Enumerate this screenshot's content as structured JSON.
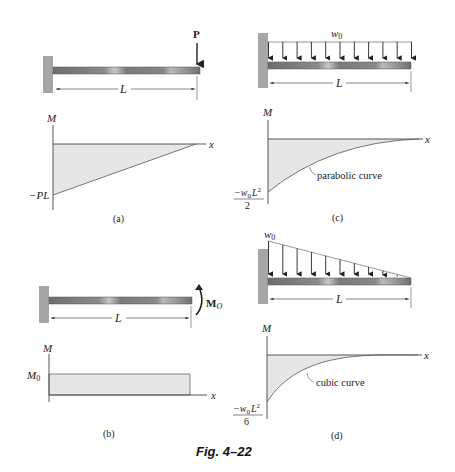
{
  "figure": {
    "caption": "Fig. 4–22",
    "colors": {
      "wall": "#a6a6a6",
      "beam": "#7a7a7a",
      "fill": "#e6e6e6",
      "line": "#333333"
    },
    "panels": [
      {
        "id": "a",
        "label": "(a)",
        "load_label": "P",
        "length_label": "L",
        "diagram": {
          "y_axis": "M",
          "x_axis": "x",
          "value_label": "−PL",
          "shape": "linear"
        }
      },
      {
        "id": "b",
        "label": "(b)",
        "load_label": "M",
        "load_sub": "O",
        "length_label": "L",
        "diagram": {
          "y_axis": "M",
          "x_axis": "x",
          "value_label": "M",
          "value_sub": "0",
          "shape": "constant"
        }
      },
      {
        "id": "c",
        "label": "(c)",
        "load_label": "w",
        "load_sub": "0",
        "length_label": "L",
        "diagram": {
          "y_axis": "M",
          "x_axis": "x",
          "value_num": "−w",
          "value_num_sub": "0",
          "value_num_tail": "L",
          "value_num_sup": "2",
          "value_den": "2",
          "curve_label": "parabolic curve",
          "shape": "parabolic"
        }
      },
      {
        "id": "d",
        "label": "(d)",
        "load_label": "w",
        "load_sub": "0",
        "length_label": "L",
        "diagram": {
          "y_axis": "M",
          "x_axis": "x",
          "value_num": "−w",
          "value_num_sub": "0",
          "value_num_tail": "L",
          "value_num_sup": "2",
          "value_den": "6",
          "curve_label": "cubic curve",
          "shape": "cubic"
        }
      }
    ]
  }
}
